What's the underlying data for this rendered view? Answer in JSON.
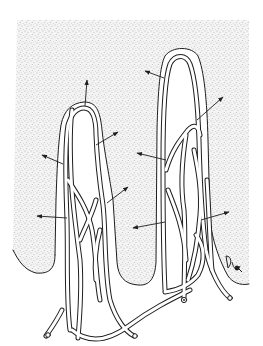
{
  "figure": {
    "subject": "intestinal villi with capillary network",
    "caption": "",
    "signature": "illegible artist initials",
    "colors": {
      "background": "#ffffff",
      "stipple": "#8a8a8a",
      "ink": "#1e1e1e",
      "vessel_fill": "#ffffff"
    },
    "arrows": [
      {
        "from": [
          85,
          106
        ],
        "to": [
          87,
          80
        ]
      },
      {
        "from": [
          96,
          145
        ],
        "to": [
          118,
          132
        ]
      },
      {
        "from": [
          63,
          164
        ],
        "to": [
          42,
          155
        ]
      },
      {
        "from": [
          67,
          218
        ],
        "to": [
          37,
          216
        ]
      },
      {
        "from": [
          107,
          203
        ],
        "to": [
          128,
          187
        ]
      },
      {
        "from": [
          165,
          222
        ],
        "to": [
          133,
          228
        ]
      },
      {
        "from": [
          164,
          78
        ],
        "to": [
          145,
          71
        ]
      },
      {
        "from": [
          197,
          120
        ],
        "to": [
          223,
          97
        ]
      },
      {
        "from": [
          166,
          160
        ],
        "to": [
          137,
          153
        ]
      },
      {
        "from": [
          201,
          220
        ],
        "to": [
          229,
          212
        ]
      }
    ]
  }
}
